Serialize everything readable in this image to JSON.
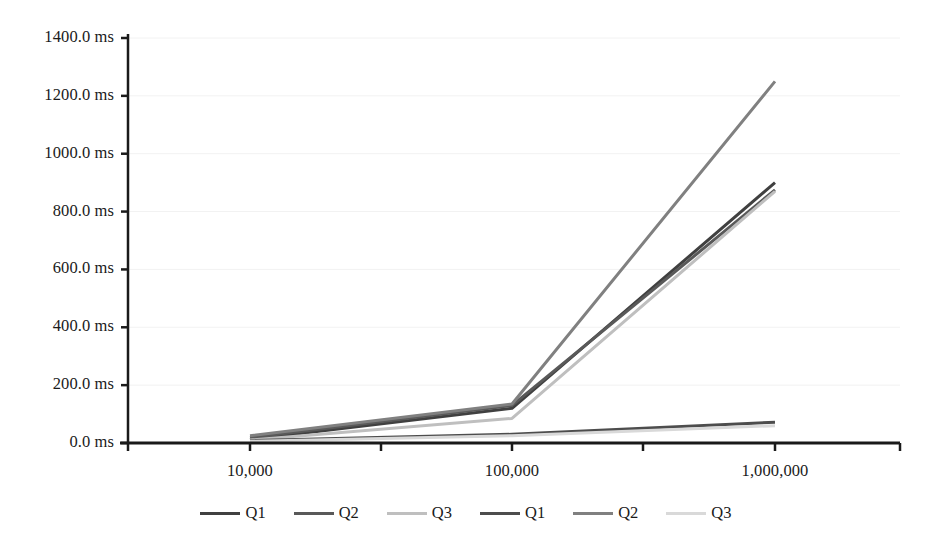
{
  "chart_data": {
    "type": "line",
    "title": "",
    "xlabel": "",
    "ylabel": "",
    "categories": [
      "10,000",
      "100,000",
      "1,000,000"
    ],
    "ylim": [
      0,
      1400
    ],
    "ytick_values": [
      0,
      200,
      400,
      600,
      800,
      1000,
      1200,
      1400
    ],
    "ytick_labels": [
      "0.0 ms",
      "200.0 ms",
      "400.0 ms",
      "600.0 ms",
      "800.0 ms",
      "1000.0 ms",
      "1200.0 ms",
      "1400.0 ms"
    ],
    "unit": "ms",
    "grid": "horizontal",
    "legend_position": "bottom",
    "series": [
      {
        "name": "Q1",
        "color": "#404040",
        "values": [
          12,
          120,
          900
        ]
      },
      {
        "name": "Q2",
        "color": "#595959",
        "values": [
          18,
          130,
          875
        ]
      },
      {
        "name": "Q3",
        "color": "#bfbfbf",
        "values": [
          10,
          85,
          870
        ]
      },
      {
        "name": "Q1",
        "color": "#4d4d4d",
        "values": [
          8,
          30,
          72
        ]
      },
      {
        "name": "Q2",
        "color": "#808080",
        "values": [
          25,
          135,
          1250
        ]
      },
      {
        "name": "Q3",
        "color": "#d9d9d9",
        "values": [
          6,
          25,
          60
        ]
      }
    ]
  },
  "legend": {
    "items": [
      {
        "label": "Q1",
        "color": "#404040"
      },
      {
        "label": "Q2",
        "color": "#595959"
      },
      {
        "label": "Q3",
        "color": "#bfbfbf"
      },
      {
        "label": "Q1",
        "color": "#4d4d4d"
      },
      {
        "label": "Q2",
        "color": "#808080"
      },
      {
        "label": "Q3",
        "color": "#d9d9d9"
      }
    ]
  },
  "axes": {
    "axis_color": "#1a1a1a",
    "grid_color": "#f2f2f2",
    "background": "#ffffff"
  }
}
